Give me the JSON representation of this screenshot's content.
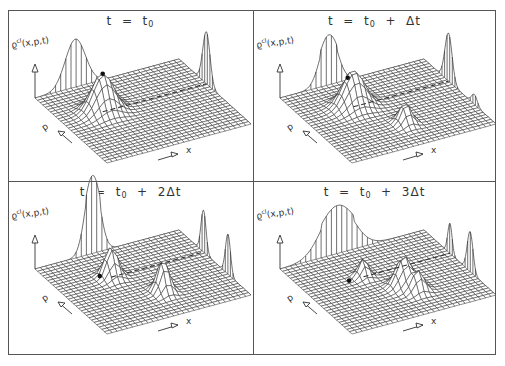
{
  "figure": {
    "frame": {
      "left": 8,
      "top": 10,
      "right": 496,
      "bottom": 355,
      "divider_x": 253,
      "divider_y": 181
    },
    "line_color": "#333333",
    "border_color": "#555555"
  },
  "chart_data": [
    {
      "type": "surface",
      "title": "t = t0",
      "title_parts": {
        "lhs": "t  =  t",
        "sub": "0",
        "rest": ""
      },
      "zlabel": "ϱcl(x,p,t)",
      "zlabel_parts": {
        "base": "ϱ",
        "sup": "cl",
        "args": "(x,p,t)"
      },
      "xlabel": "x",
      "plabel": "p",
      "grid_cells": 28,
      "peaks_2d": [
        {
          "x": 0.28,
          "p": 0.62,
          "sx": 0.07,
          "sp": 0.07,
          "h": 38
        }
      ],
      "marker": {
        "x": 0.28,
        "p": 0.62
      },
      "ridge_lines": [
        {
          "p": 0.62,
          "from_x": 0.28,
          "to_x": 1.0
        }
      ],
      "marginal_x": [
        {
          "c": 0.28,
          "s": 0.07,
          "h": 48
        }
      ],
      "marginal_p": [
        {
          "c": 0.62,
          "s": 0.05,
          "h": 52
        }
      ]
    },
    {
      "type": "surface",
      "title": "t = t0 + Δt",
      "title_parts": {
        "lhs": "t  =  t",
        "sub": "0",
        "rest": "  +  Δt"
      },
      "zlabel": "ϱcl(x,p,t)",
      "zlabel_parts": {
        "base": "ϱ",
        "sup": "cl",
        "args": "(x,p,t)"
      },
      "xlabel": "x",
      "plabel": "p",
      "grid_cells": 28,
      "peaks_2d": [
        {
          "x": 0.34,
          "p": 0.66,
          "sx": 0.07,
          "sp": 0.07,
          "h": 36
        },
        {
          "x": 0.52,
          "p": 0.3,
          "sx": 0.035,
          "sp": 0.05,
          "h": 20
        }
      ],
      "marker": {
        "x": 0.3,
        "p": 0.66
      },
      "ridge_lines": [
        {
          "p": 0.66,
          "from_x": 0.34,
          "to_x": 1.0
        }
      ],
      "marginal_x": [
        {
          "c": 0.34,
          "s": 0.06,
          "h": 50,
          "flat": true
        }
      ],
      "marginal_p": [
        {
          "c": 0.66,
          "s": 0.05,
          "h": 48
        },
        {
          "c": 0.3,
          "s": 0.04,
          "h": 10
        }
      ]
    },
    {
      "type": "surface",
      "title": "t = t0 + 2Δt",
      "title_parts": {
        "lhs": "t  =  t",
        "sub": "0",
        "rest": "  +  2Δt"
      },
      "zlabel": "ϱcl(x,p,t)",
      "zlabel_parts": {
        "base": "ϱ",
        "sup": "cl",
        "args": "(x,p,t)"
      },
      "xlabel": "x",
      "plabel": "p",
      "grid_cells": 28,
      "peaks_2d": [
        {
          "x": 0.36,
          "p": 0.66,
          "sx": 0.04,
          "sp": 0.05,
          "h": 30
        },
        {
          "x": 0.55,
          "p": 0.32,
          "sx": 0.035,
          "sp": 0.05,
          "h": 32
        }
      ],
      "marker": {
        "x": 0.28,
        "p": 0.66
      },
      "ridge_lines": [
        {
          "p": 0.66,
          "from_x": 0.36,
          "to_x": 1.0
        }
      ],
      "marginal_x": [
        {
          "c": 0.4,
          "s": 0.05,
          "h": 78,
          "flat": true
        }
      ],
      "marginal_p": [
        {
          "c": 0.66,
          "s": 0.035,
          "h": 42
        },
        {
          "c": 0.32,
          "s": 0.035,
          "h": 40
        }
      ]
    },
    {
      "type": "surface",
      "title": "t = t0 + 3Δt",
      "title_parts": {
        "lhs": "t  =  t",
        "sub": "0",
        "rest": "  +  3Δt"
      },
      "zlabel": "ϱcl(x,p,t)",
      "zlabel_parts": {
        "base": "ϱ",
        "sup": "cl",
        "args": "(x,p,t)"
      },
      "xlabel": "x",
      "plabel": "p",
      "grid_cells": 28,
      "peaks_2d": [
        {
          "x": 0.4,
          "p": 0.64,
          "sx": 0.03,
          "sp": 0.04,
          "h": 18
        },
        {
          "x": 0.56,
          "p": 0.4,
          "sx": 0.05,
          "sp": 0.05,
          "h": 30
        },
        {
          "x": 0.6,
          "p": 0.28,
          "sx": 0.04,
          "sp": 0.04,
          "h": 20
        }
      ],
      "marker": {
        "x": 0.3,
        "p": 0.64
      },
      "ridge_lines": [
        {
          "p": 0.64,
          "from_x": 0.4,
          "to_x": 1.0
        }
      ],
      "marginal_x": [
        {
          "c": 0.4,
          "s": 0.11,
          "h": 48,
          "flat": true
        }
      ],
      "marginal_p": [
        {
          "c": 0.64,
          "s": 0.03,
          "h": 30
        },
        {
          "c": 0.36,
          "s": 0.04,
          "h": 40
        }
      ]
    }
  ]
}
